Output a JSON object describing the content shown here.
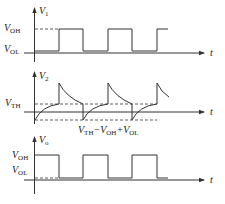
{
  "panels": [
    {
      "name": "v1",
      "y_label": "V",
      "y_label_sub": "1",
      "x_label": "t",
      "level_labels": [
        {
          "main": "V",
          "sub": "OH"
        },
        {
          "main": "V",
          "sub": "OL"
        }
      ]
    },
    {
      "name": "v2",
      "y_label": "V",
      "y_label_sub": "2",
      "x_label": "t",
      "level_labels": [
        {
          "main": "V",
          "sub": "TH"
        }
      ],
      "annotation": {
        "parts": [
          {
            "main": "V",
            "sub": "TH"
          },
          {
            "op": "−",
            "main": "V",
            "sub": "OH"
          },
          {
            "op": "+",
            "main": "V",
            "sub": "OL"
          }
        ]
      }
    },
    {
      "name": "vo",
      "y_label": "V",
      "y_label_sub": "o",
      "x_label": "t",
      "level_labels": [
        {
          "main": "V",
          "sub": "OH"
        },
        {
          "main": "V",
          "sub": "OL"
        }
      ]
    }
  ],
  "colors": {
    "line": "#333333",
    "background": "#ffffff"
  }
}
